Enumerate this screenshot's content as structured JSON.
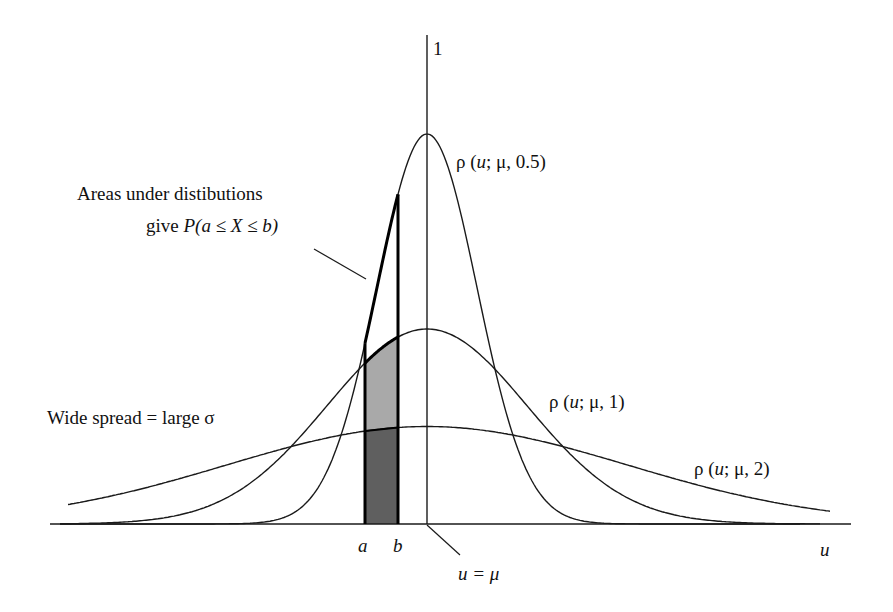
{
  "axis": {
    "y_top_label": "1",
    "x_label": "u",
    "mean_label": "u = μ",
    "a_label": "a",
    "b_label": "b"
  },
  "curves": [
    {
      "id": "narrow",
      "sigma": 0.5,
      "label_prefix": "ρ (",
      "label_var": "u",
      "label_suffix": "; μ, 0.5)"
    },
    {
      "id": "medium",
      "sigma": 1,
      "label_prefix": "ρ (",
      "label_var": "u",
      "label_suffix": "; μ, 1)"
    },
    {
      "id": "wide",
      "sigma": 2,
      "label_prefix": "ρ (",
      "label_var": "u",
      "label_suffix": "; μ, 2)"
    }
  ],
  "annotations": {
    "areas_line1": "Areas under distibutions",
    "areas_line2_prefix": "give ",
    "areas_line2_formula": "P(a ≤ X ≤ b)",
    "wide_spread": "Wide spread = large σ"
  },
  "colors": {
    "light_fill": "#a9a9a9",
    "dark_fill": "#5f5f5f",
    "line": "#1a1a1a"
  },
  "chart_data": {
    "type": "line",
    "title": "",
    "xlabel": "u",
    "ylabel": "",
    "y_tick": "1",
    "series": [
      {
        "name": "ρ(u; μ, 0.5)",
        "sigma": 0.5,
        "peak_relative": 1.0
      },
      {
        "name": "ρ(u; μ, 1)",
        "sigma": 1,
        "peak_relative": 0.5
      },
      {
        "name": "ρ(u; μ, 2)",
        "sigma": 2,
        "peak_relative": 0.25
      }
    ],
    "shaded_interval": {
      "from": "a",
      "to": "b",
      "a_offset_sigma_units": -0.62,
      "b_offset_sigma_units": -0.29
    },
    "xlim": [
      -3.77,
      4.23
    ],
    "grid": false
  }
}
